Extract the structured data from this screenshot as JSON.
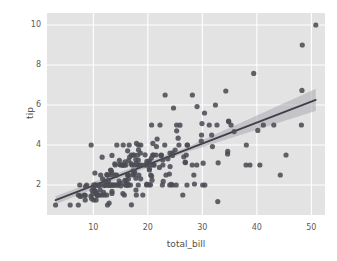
{
  "figure": {
    "background_color": "#ffffff",
    "width": 337,
    "height": 261
  },
  "axes": {
    "background_color": "#e3e3e3",
    "grid_color": "#ffffff",
    "tick_label_color": "#5a5a5a",
    "axis_label_color": "#4f4f4f"
  },
  "style": {
    "point_color": "#4c4c55",
    "line_color": "#3f3f47",
    "band_color": "#b0b0b8"
  },
  "chart_data": {
    "type": "scatter",
    "title": "",
    "subtitle": "",
    "xlabel": "total_bill",
    "ylabel": "tip",
    "xlim": [
      1.5,
      52.5
    ],
    "ylim": [
      0.5,
      10.6
    ],
    "xticks": [
      10,
      20,
      30,
      40,
      50
    ],
    "yticks": [
      2,
      4,
      6,
      8,
      10
    ],
    "xtick_labels": [
      "10",
      "20",
      "30",
      "40",
      "50"
    ],
    "ytick_labels": [
      "2",
      "4",
      "6",
      "8",
      "10"
    ],
    "grid": true,
    "legend": null,
    "legend_position": "none",
    "marker": "circle",
    "marker_size": 5.2,
    "regression": {
      "type": "linear",
      "slope": 0.105,
      "intercept": 0.92,
      "x_start": 3.07,
      "x_end": 50.81,
      "confidence_interval": 95,
      "ci_half_width_at_x_start": 0.2,
      "ci_half_width_at_x_mid": 0.12,
      "ci_half_width_at_x_end": 0.55
    },
    "series": [
      {
        "name": "tips",
        "x": [
          16.99,
          10.34,
          21.01,
          23.68,
          24.59,
          25.29,
          8.77,
          26.88,
          15.04,
          14.78,
          10.27,
          35.26,
          15.42,
          18.43,
          14.83,
          21.58,
          10.33,
          16.29,
          16.97,
          20.65,
          17.92,
          20.29,
          15.77,
          39.42,
          19.82,
          17.81,
          13.37,
          12.69,
          21.7,
          19.65,
          9.55,
          18.35,
          15.06,
          20.69,
          17.78,
          24.06,
          16.31,
          16.93,
          18.69,
          31.27,
          16.04,
          17.46,
          13.94,
          9.68,
          30.4,
          18.29,
          22.23,
          32.4,
          28.55,
          18.04,
          12.54,
          10.29,
          34.81,
          9.94,
          25.56,
          19.49,
          38.01,
          26.41,
          11.24,
          48.27,
          20.29,
          13.81,
          11.02,
          18.29,
          17.59,
          20.08,
          16.45,
          3.07,
          20.23,
          15.01,
          12.02,
          17.07,
          26.86,
          25.28,
          14.73,
          10.51,
          17.92,
          27.2,
          22.76,
          17.29,
          19.44,
          16.66,
          10.07,
          32.68,
          15.98,
          34.83,
          13.03,
          18.28,
          24.71,
          21.16,
          28.97,
          22.49,
          5.75,
          16.32,
          22.75,
          40.17,
          27.28,
          12.03,
          21.01,
          12.46,
          11.35,
          15.38,
          44.3,
          22.42,
          20.92,
          15.36,
          20.49,
          25.21,
          18.24,
          14.31,
          14.0,
          7.25,
          38.07,
          23.95,
          25.71,
          17.31,
          29.93,
          10.65,
          12.43,
          24.08,
          11.69,
          13.42,
          14.26,
          15.95,
          12.48,
          29.8,
          8.52,
          14.52,
          11.38,
          22.82,
          19.08,
          20.27,
          11.17,
          12.26,
          18.26,
          8.51,
          10.33,
          14.15,
          16.0,
          13.16,
          17.47,
          34.3,
          41.19,
          27.05,
          16.43,
          8.35,
          18.64,
          11.87,
          9.78,
          7.51,
          14.07,
          13.13,
          17.26,
          24.55,
          19.77,
          29.85,
          48.17,
          25.0,
          13.39,
          16.49,
          21.5,
          12.66,
          16.21,
          13.81,
          17.51,
          24.52,
          20.76,
          31.71,
          10.59,
          10.63,
          50.81,
          15.81,
          7.25,
          31.85,
          16.82,
          32.9,
          17.89,
          14.48,
          9.6,
          34.63,
          34.65,
          23.33,
          45.35,
          23.17,
          40.55,
          20.69,
          20.9,
          30.46,
          18.15,
          23.1,
          15.69,
          19.81,
          28.44,
          15.48,
          16.58,
          7.56,
          10.34,
          43.11,
          13.0,
          13.51,
          18.71,
          12.74,
          13.0,
          16.4,
          20.53,
          16.47,
          26.59,
          38.73,
          24.27,
          12.76,
          30.06,
          25.89,
          48.33,
          13.27,
          28.17,
          12.9,
          28.15,
          11.59,
          7.74,
          30.14,
          12.16,
          13.42,
          8.58,
          15.98,
          13.42,
          16.27,
          10.09,
          20.45,
          13.28,
          22.12,
          24.01,
          15.69,
          11.61,
          10.77,
          15.53,
          10.07,
          12.6,
          32.83,
          35.83,
          29.03,
          27.18,
          22.67,
          17.82,
          18.78
        ],
        "y": [
          1.01,
          1.66,
          3.5,
          3.31,
          3.61,
          4.71,
          2.0,
          3.12,
          1.96,
          3.23,
          1.71,
          5.0,
          1.57,
          3.0,
          3.02,
          3.92,
          1.67,
          3.71,
          3.5,
          3.35,
          4.08,
          2.75,
          2.23,
          7.58,
          3.18,
          2.34,
          2.0,
          2.0,
          4.3,
          3.0,
          1.45,
          2.5,
          3.0,
          2.45,
          3.27,
          3.6,
          2.0,
          3.07,
          2.31,
          5.0,
          2.24,
          2.54,
          3.06,
          1.32,
          5.6,
          3.0,
          5.0,
          6.0,
          2.05,
          3.0,
          2.5,
          2.6,
          5.2,
          1.56,
          4.34,
          3.51,
          3.0,
          1.5,
          1.76,
          6.73,
          3.21,
          2.0,
          1.98,
          3.76,
          2.64,
          3.15,
          2.47,
          1.0,
          2.01,
          2.09,
          1.97,
          3.0,
          3.14,
          5.0,
          2.2,
          1.25,
          3.08,
          4.0,
          3.0,
          2.71,
          3.0,
          3.4,
          1.83,
          5.0,
          2.03,
          5.17,
          2.0,
          4.0,
          5.85,
          3.0,
          3.0,
          3.5,
          1.0,
          2.05,
          3.25,
          4.73,
          4.0,
          1.5,
          3.0,
          1.5,
          2.5,
          3.0,
          2.5,
          3.48,
          4.08,
          3.0,
          2.01,
          2.0,
          2.0,
          4.0,
          3.0,
          1.0,
          4.0,
          2.55,
          4.0,
          3.5,
          5.07,
          1.5,
          2.0,
          2.92,
          2.31,
          1.68,
          2.5,
          2.0,
          2.52,
          4.2,
          1.48,
          2.0,
          2.0,
          2.18,
          1.5,
          2.83,
          1.5,
          2.0,
          3.25,
          1.25,
          2.0,
          2.0,
          2.0,
          2.75,
          3.5,
          6.7,
          5.0,
          3.5,
          2.3,
          1.5,
          3.6,
          1.63,
          1.73,
          2.0,
          2.5,
          2.0,
          2.5,
          2.0,
          2.0,
          4.5,
          5.0,
          3.75,
          2.61,
          2.0,
          3.5,
          2.5,
          2.0,
          2.0,
          3.0,
          3.48,
          2.24,
          4.5,
          1.61,
          2.0,
          10.0,
          3.16,
          1.5,
          3.92,
          2.0,
          3.11,
          1.5,
          2.0,
          4.0,
          3.55,
          3.68,
          2.5,
          3.5,
          6.5,
          3.0,
          5.0,
          3.5,
          2.0,
          3.5,
          4.0,
          1.5,
          2.05,
          2.5,
          4.0,
          4.0,
          1.44,
          2.0,
          5.0,
          2.0,
          2.0,
          4.0,
          2.01,
          2.0,
          2.5,
          2.5,
          3.23,
          3.41,
          3.0,
          2.03,
          2.23,
          2.0,
          4.99,
          9.0,
          2.5,
          6.5,
          1.1,
          3.0,
          1.5,
          1.44,
          3.09,
          2.2,
          3.48,
          1.92,
          3.0,
          1.58,
          2.5,
          2.0,
          3.0,
          2.72,
          2.88,
          2.0,
          3.0,
          3.39,
          1.47,
          3.0,
          1.25,
          1.0,
          1.17,
          4.67,
          5.92,
          2.0,
          2.0,
          1.75,
          3.0
        ]
      }
    ]
  }
}
